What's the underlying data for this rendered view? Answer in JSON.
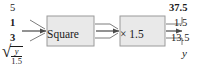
{
  "figure": {
    "type": "function-machine-diagram",
    "colors": {
      "box_fill": "#e9e9e9",
      "box_border": "#9a9a9a",
      "line": "#6f6f6f",
      "text": "#1a1a1a"
    }
  },
  "inputs": {
    "values": [
      {
        "text": "5",
        "bold": false
      },
      {
        "text": "1",
        "bold": true
      },
      {
        "text": "3",
        "bold": true
      }
    ],
    "general": {
      "radical_sign": "√",
      "numerator": "y",
      "denominator": "1.5"
    }
  },
  "boxes": [
    {
      "label": "Square"
    },
    {
      "label": "× 1.5"
    }
  ],
  "outputs": {
    "values": [
      {
        "text": "37.5",
        "bold": true
      },
      {
        "text": "1.5",
        "bold": false
      },
      {
        "text": "13.5",
        "bold": false
      }
    ],
    "general": "y"
  }
}
